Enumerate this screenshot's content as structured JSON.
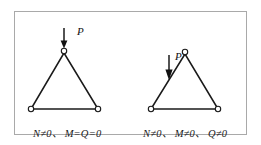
{
  "figure": {
    "background_color": "#ffffff",
    "frame_color": "#a9a9a9",
    "stroke_color": "#1a1a1a",
    "panels": [
      {
        "id": "left-panel",
        "name": "axial-load-at-apex",
        "load_label": "P",
        "caption": "N≠0、 M=Q=0",
        "arrow_target": "apex-node",
        "truss": {
          "apex": [
            63,
            51
          ],
          "base_left": [
            30,
            108
          ],
          "base_right": [
            97,
            108
          ]
        },
        "arrow": {
          "x": 63,
          "y_start": 27,
          "y_end": 49
        }
      },
      {
        "id": "right-panel",
        "name": "eccentric-load-on-member",
        "load_label": "P",
        "caption": "N≠0、 M≠0、 Q≠0",
        "arrow_target": "left-chord-midspan",
        "truss": {
          "apex": [
            184,
            52
          ],
          "base_left": [
            150,
            108
          ],
          "base_right": [
            217,
            108
          ]
        },
        "arrow": {
          "x": 168,
          "y_start": 52,
          "y_end": 79
        }
      }
    ]
  }
}
